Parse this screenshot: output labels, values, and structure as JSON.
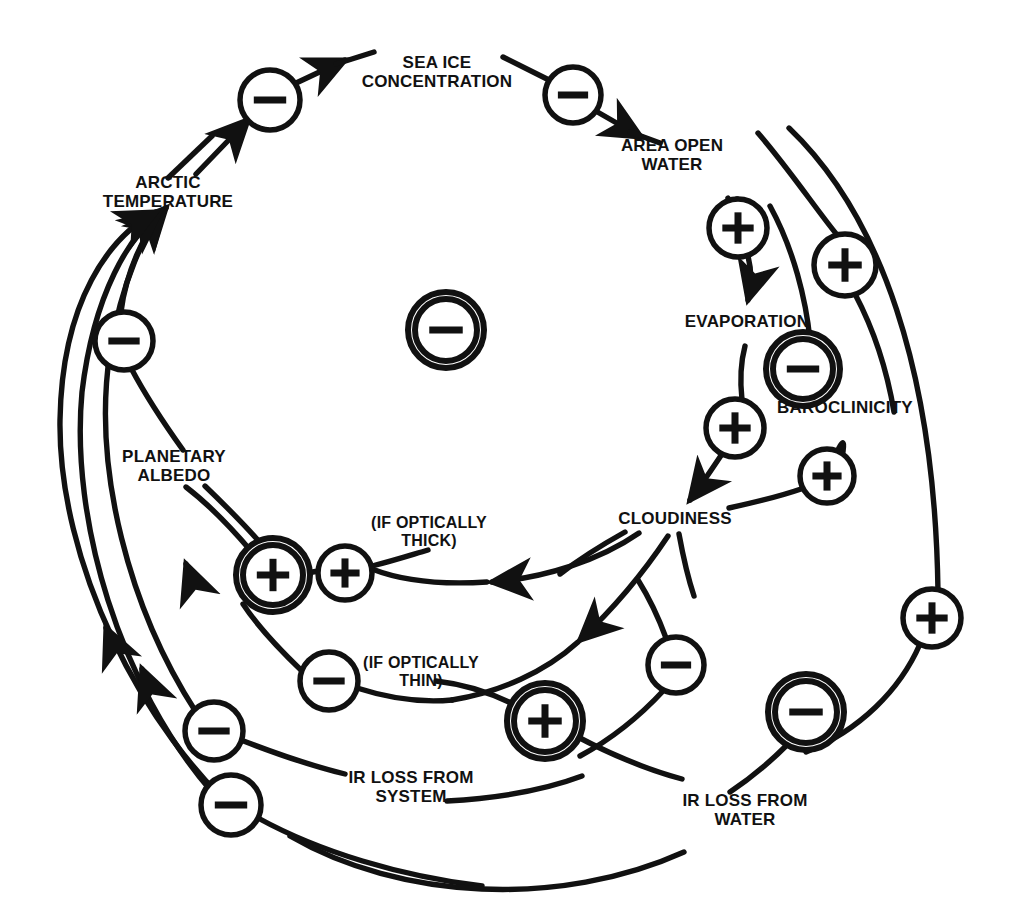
{
  "figure": {
    "ink_color": "#111111",
    "background_color": "#ffffff"
  },
  "nodes": [
    {
      "id": "sea-ice-concentration",
      "label": "SEA ICE\nCONCENTRATION",
      "x": 437,
      "y": 72
    },
    {
      "id": "arctic-temperature",
      "label": "ARCTIC\nTEMPERATURE",
      "x": 168,
      "y": 192
    },
    {
      "id": "area-open-water",
      "label": "AREA OPEN\nWATER",
      "x": 672,
      "y": 155
    },
    {
      "id": "evaporation",
      "label": "EVAPORATION",
      "x": 747,
      "y": 322
    },
    {
      "id": "baroclinicity",
      "label": "BAROCLINICITY",
      "x": 845,
      "y": 408
    },
    {
      "id": "cloudiness",
      "label": "CLOUDINESS",
      "x": 675,
      "y": 519
    },
    {
      "id": "planetary-albedo",
      "label": "PLANETARY\nALBEDO",
      "x": 174,
      "y": 466
    },
    {
      "id": "if-optically-thick",
      "label": "(IF OPTICALLY\nTHICK)",
      "x": 429,
      "y": 532
    },
    {
      "id": "if-optically-thin",
      "label": "(IF OPTICALLY\nTHIN)",
      "x": 421,
      "y": 672
    },
    {
      "id": "ir-loss-from-system",
      "label": "IR LOSS FROM\nSYSTEM",
      "x": 411,
      "y": 787
    },
    {
      "id": "ir-loss-from-water",
      "label": "IR LOSS FROM\nWATER",
      "x": 745,
      "y": 810
    }
  ],
  "polarity_markers": [
    {
      "id": "marker-sea-ice-to-temp",
      "sign": "−",
      "x": 270,
      "y": 100,
      "r": 30,
      "double": false
    },
    {
      "id": "marker-sea-ice-to-open-water",
      "sign": "−",
      "x": 573,
      "y": 95,
      "r": 28,
      "double": false
    },
    {
      "id": "marker-open-water-to-evaporation",
      "sign": "+",
      "x": 738,
      "y": 228,
      "r": 29,
      "double": false
    },
    {
      "id": "marker-open-water-to-baroclinicity",
      "sign": "+",
      "x": 845,
      "y": 265,
      "r": 31,
      "double": false
    },
    {
      "id": "marker-evaporation-to-cloudiness",
      "sign": "+",
      "x": 735,
      "y": 428,
      "r": 29,
      "double": false
    },
    {
      "id": "marker-baroclinicity-loop",
      "sign": "−",
      "x": 803,
      "y": 369,
      "r": 30,
      "double": true
    },
    {
      "id": "marker-baroclinicity-to-cloudiness",
      "sign": "+",
      "x": 827,
      "y": 476,
      "r": 27,
      "double": false
    },
    {
      "id": "marker-center-loop",
      "sign": "−",
      "x": 446,
      "y": 330,
      "r": 31,
      "double": true
    },
    {
      "id": "marker-temp-albedo",
      "sign": "−",
      "x": 124,
      "y": 341,
      "r": 29,
      "double": false
    },
    {
      "id": "marker-albedo-thick-loop",
      "sign": "+",
      "x": 273,
      "y": 575,
      "r": 30,
      "double": true
    },
    {
      "id": "marker-cloud-thick",
      "sign": "+",
      "x": 345,
      "y": 573,
      "r": 27,
      "double": false
    },
    {
      "id": "marker-cloud-thin",
      "sign": "−",
      "x": 329,
      "y": 681,
      "r": 29,
      "double": false
    },
    {
      "id": "marker-ir-system-loop",
      "sign": "+",
      "x": 545,
      "y": 721,
      "r": 31,
      "double": true
    },
    {
      "id": "marker-ir-system-a",
      "sign": "−",
      "x": 214,
      "y": 731,
      "r": 29,
      "double": false
    },
    {
      "id": "marker-ir-system-b",
      "sign": "−",
      "x": 231,
      "y": 805,
      "r": 30,
      "double": false
    },
    {
      "id": "marker-ir-water",
      "sign": "−",
      "x": 676,
      "y": 665,
      "r": 28,
      "double": false
    },
    {
      "id": "marker-ir-water-loop",
      "sign": "−",
      "x": 806,
      "y": 712,
      "r": 31,
      "double": true
    },
    {
      "id": "marker-far-right",
      "sign": "+",
      "x": 932,
      "y": 618,
      "r": 29,
      "double": false
    }
  ],
  "links": [
    {
      "id": "link-arctic-temp-to-sea-ice",
      "from": "arctic-temperature",
      "to": "sea-ice-concentration",
      "sign": "−"
    },
    {
      "id": "link-sea-ice-to-open-water",
      "from": "sea-ice-concentration",
      "to": "area-open-water",
      "sign": "−"
    },
    {
      "id": "link-open-water-to-evaporation",
      "from": "area-open-water",
      "to": "evaporation",
      "sign": "+"
    },
    {
      "id": "link-open-water-to-baroclinicity",
      "from": "area-open-water",
      "to": "baroclinicity",
      "sign": "+"
    },
    {
      "id": "link-evaporation-to-cloudiness",
      "from": "evaporation",
      "to": "cloudiness",
      "sign": "+"
    },
    {
      "id": "link-baroclinicity-to-cloudiness",
      "from": "baroclinicity",
      "to": "cloudiness",
      "sign": "+"
    },
    {
      "id": "link-cloudiness-to-albedo-thick",
      "from": "cloudiness",
      "to": "planetary-albedo",
      "sign": "+"
    },
    {
      "id": "link-cloudiness-to-ir-loss-thin",
      "from": "cloudiness",
      "to": "ir-loss-from-system",
      "sign": "−"
    },
    {
      "id": "link-albedo-to-arctic-temp",
      "from": "planetary-albedo",
      "to": "arctic-temperature",
      "sign": "−"
    },
    {
      "id": "link-ir-system-to-arctic-temp",
      "from": "ir-loss-from-system",
      "to": "arctic-temperature",
      "sign": "−"
    },
    {
      "id": "link-ir-water-to-arctic-temp",
      "from": "ir-loss-from-water",
      "to": "arctic-temperature",
      "sign": "−"
    },
    {
      "id": "link-open-water-to-ir-water",
      "from": "area-open-water",
      "to": "ir-loss-from-water",
      "sign": "+"
    }
  ]
}
